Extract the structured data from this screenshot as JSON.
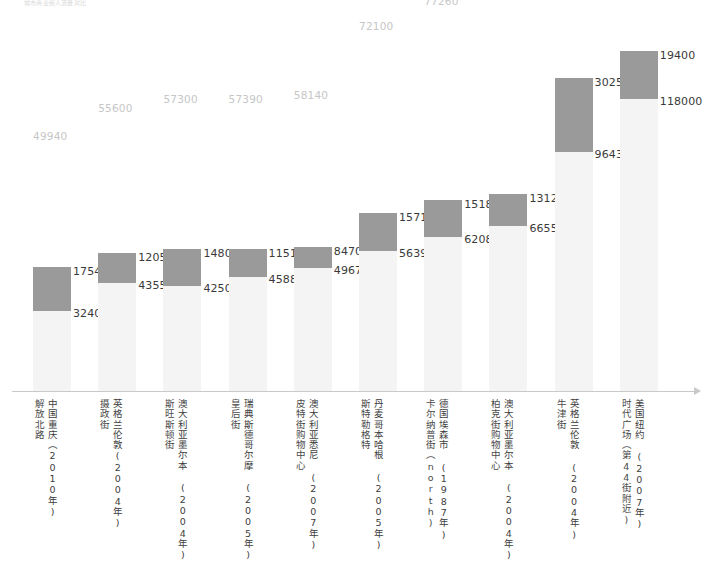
{
  "chart_caption": "城市商业街人流量对比",
  "axis": {
    "baseline_label": "",
    "arrow_icon": "axis-arrow-right"
  },
  "chart_data": {
    "type": "bar",
    "subtype": "stacked-bar",
    "title": "城市商业街人流量对比",
    "xlabel": "",
    "ylabel": "",
    "grid": false,
    "legend_position": "none",
    "ylim": [
      0,
      137400
    ],
    "categories": [
      "解放北路",
      "摄政街",
      "斯旺斯顿街",
      "皇后街",
      "皮特街购物中心",
      "斯特勒格特",
      "卡尔纳普街（north）",
      "柏克街购物中心",
      "牛津街",
      "时代广场（第44街附近）"
    ],
    "series": [
      {
        "name": "上段",
        "values": [
          17540,
          12050,
          14800,
          11510,
          8470,
          15710,
          15180,
          13120,
          30250,
          19400
        ]
      },
      {
        "name": "下段",
        "values": [
          32400,
          43550,
          42500,
          45880,
          49670,
          56390,
          62080,
          66550,
          96430,
          118000
        ]
      }
    ],
    "totals": [
      49940,
      55600,
      57300,
      57390,
      58140,
      72100,
      77260,
      79670,
      126680,
      137400
    ],
    "total_labels": [
      "49940",
      "55600",
      "57300",
      "57390",
      "58140",
      "72100",
      "77260",
      "79670",
      "126680",
      "137400"
    ],
    "total_footnote_flags": [
      false,
      false,
      false,
      false,
      false,
      false,
      false,
      false,
      false,
      true
    ],
    "footnote_marker": "*"
  },
  "colors": {
    "segment_top": "#9a9a9a",
    "segment_bottom": "#f4f4f4",
    "total_label": "#c6c6c6",
    "value_label": "#3a3a3a",
    "axis": "#c9c9c9"
  },
  "bars": [
    {
      "total": "49940",
      "starred": false,
      "top_value": "17540",
      "bottom_value": "32400",
      "street": "解放北路",
      "place": "中国重庆（2010年)"
    },
    {
      "total": "55600",
      "starred": false,
      "top_value": "12050",
      "bottom_value": "43550",
      "street": "摄政街",
      "place": "英格兰伦敦(2004年)"
    },
    {
      "total": "57300",
      "starred": false,
      "top_value": "14800",
      "bottom_value": "42500",
      "street": "斯旺斯顿街",
      "place": "澳大利亚墨尔本 (2004年)"
    },
    {
      "total": "57390",
      "starred": false,
      "top_value": "11510",
      "bottom_value": "45880",
      "street": "皇后街",
      "place": "瑞典斯德哥尔摩 (2005年)"
    },
    {
      "total": "58140",
      "starred": false,
      "top_value": "8470",
      "bottom_value": "49670",
      "street": "皮特街购物中心",
      "place": "澳大利亚悉尼 (2007年)"
    },
    {
      "total": "72100",
      "starred": false,
      "top_value": "15710",
      "bottom_value": "56390",
      "street": "斯特勒格特",
      "place": "丹麦哥本哈根 (2005年)"
    },
    {
      "total": "77260",
      "starred": false,
      "top_value": "15180",
      "bottom_value": "62080",
      "street": "卡尔纳普街（north)",
      "place": "德国埃森市 (1987年)"
    },
    {
      "total": "79670",
      "starred": false,
      "top_value": "13120",
      "bottom_value": "66550",
      "street": "柏克街购物中心",
      "place": "澳大利亚墨尔本 (2004年)"
    },
    {
      "total": "126680",
      "starred": false,
      "top_value": "30250",
      "bottom_value": "96430",
      "street": "牛津街",
      "place": "英格兰伦敦 (2004年)"
    },
    {
      "total": "137400",
      "starred": true,
      "top_value": "19400",
      "bottom_value": "118000",
      "street": "时代广场（第44街附近)",
      "place": "美国纽约 (2007年)"
    }
  ]
}
